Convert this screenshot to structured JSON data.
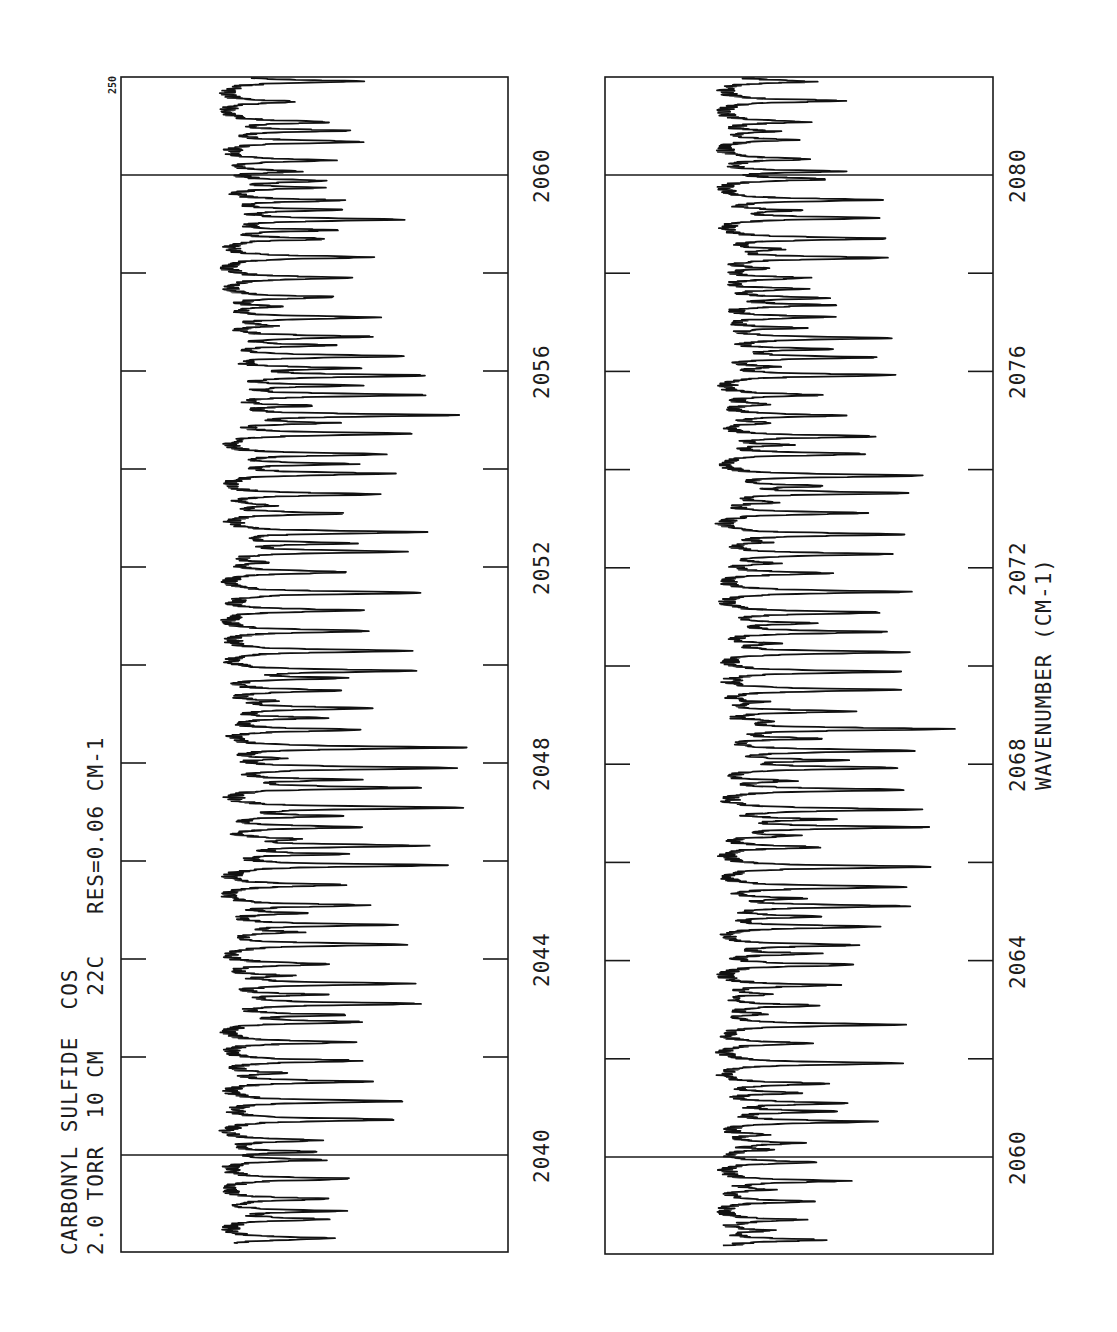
{
  "chart_data": {
    "type": "line",
    "title": "CARBONYL SULFIDE  COS",
    "subtitle": "2.0 TORR  10 CM  22C  RES=0.06 CM-1",
    "conditions": {
      "compound": "CARBONYL SULFIDE",
      "formula": "COS",
      "pressure": "2.0 TORR",
      "path_length": "10 CM",
      "temperature": "22C",
      "resolution": "RES=0.06 CM-1"
    },
    "xlabel": "WAVENUMBER (CM-1)",
    "ylabel": "",
    "orientation": "rotated 90° counter-clockwise (wavenumber increases upward; absorption extends rightward)",
    "scale_label": "250",
    "grid": false,
    "legend": null,
    "panels": [
      {
        "name": "upper-range",
        "xlim": [
          2038.2,
          2062.2
        ],
        "major_ticks": [
          2040,
          2044,
          2048,
          2052,
          2056,
          2060
        ],
        "minor_ticks": [
          2042,
          2046,
          2050,
          2054,
          2058
        ],
        "reference_lines": [
          2040,
          2060
        ],
        "line_spacing_cm1": 0.4,
        "baseline_fraction": 0.27,
        "max_depth_fraction": 0.92,
        "deepest_line_near": 2058.3
      },
      {
        "name": "lower-range",
        "xlim": [
          2058.2,
          2082.2
        ],
        "major_ticks": [
          2060,
          2064,
          2068,
          2072,
          2076,
          2080
        ],
        "minor_ticks": [
          2062,
          2066,
          2070,
          2074,
          2078
        ],
        "reference_lines": [
          2060,
          2080
        ],
        "line_spacing_cm1": 0.4,
        "baseline_fraction": 0.3,
        "max_depth_fraction": 0.9,
        "deepest_line_near": 2058.4
      }
    ]
  },
  "labels": {
    "title_line1": "CARBONYL SULFIDE  COS",
    "title_line2": "2.0 TORR  10 CM    22C   RES=0.06 CM-1",
    "scale": "250",
    "xaxis_title": "WAVENUMBER (CM-1)",
    "panel1_ticks": [
      "2040",
      "2044",
      "2048",
      "2052",
      "2056",
      "2060"
    ],
    "panel2_ticks": [
      "2060",
      "2064",
      "2068",
      "2072",
      "2076",
      "2080"
    ]
  },
  "colors": {
    "ink": "#1a1a1a",
    "background": "#ffffff"
  }
}
